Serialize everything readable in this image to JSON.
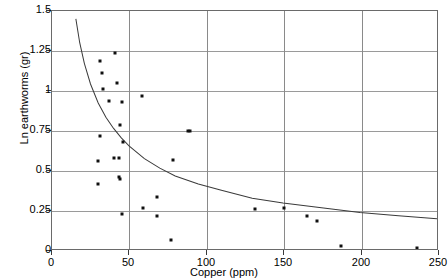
{
  "chart_data": {
    "type": "scatter",
    "title": "",
    "xlabel": "Copper (ppm)",
    "ylabel": "Ln earthworms (gr)",
    "xlim": [
      0,
      250
    ],
    "ylim": [
      0,
      1.5
    ],
    "xticks": [
      0,
      50,
      100,
      150,
      200,
      250
    ],
    "xtick_labels": [
      "0",
      "50",
      "100",
      "150",
      "200",
      "250"
    ],
    "yticks": [
      0,
      0.25,
      0.5,
      0.75,
      1,
      1.25,
      1.5
    ],
    "ytick_labels": [
      "0",
      "0.25",
      "0.5",
      "0.75",
      "1",
      "1.25",
      "1.5"
    ],
    "grid": true,
    "legend": "none",
    "marker_color": "#101010",
    "curve_color": "#3a3a3a",
    "grid_color": "#9a9a9a",
    "axis_color": "#6a6a6a",
    "points": [
      {
        "x": 31,
        "y": 1.19
      },
      {
        "x": 41,
        "y": 1.24
      },
      {
        "x": 32,
        "y": 1.11
      },
      {
        "x": 42,
        "y": 1.05
      },
      {
        "x": 33,
        "y": 1.01
      },
      {
        "x": 37,
        "y": 0.94
      },
      {
        "x": 45,
        "y": 0.93
      },
      {
        "x": 58,
        "y": 0.97
      },
      {
        "x": 44,
        "y": 0.79
      },
      {
        "x": 31,
        "y": 0.72
      },
      {
        "x": 46,
        "y": 0.68
      },
      {
        "x": 88,
        "y": 0.75
      },
      {
        "x": 89,
        "y": 0.75
      },
      {
        "x": 30,
        "y": 0.56
      },
      {
        "x": 40,
        "y": 0.58
      },
      {
        "x": 43,
        "y": 0.58
      },
      {
        "x": 78,
        "y": 0.57
      },
      {
        "x": 30,
        "y": 0.42
      },
      {
        "x": 43,
        "y": 0.46
      },
      {
        "x": 44,
        "y": 0.45
      },
      {
        "x": 68,
        "y": 0.34
      },
      {
        "x": 59,
        "y": 0.27
      },
      {
        "x": 45,
        "y": 0.23
      },
      {
        "x": 68,
        "y": 0.22
      },
      {
        "x": 77,
        "y": 0.07
      },
      {
        "x": 131,
        "y": 0.26
      },
      {
        "x": 150,
        "y": 0.27
      },
      {
        "x": 165,
        "y": 0.22
      },
      {
        "x": 171,
        "y": 0.19
      },
      {
        "x": 187,
        "y": 0.03
      },
      {
        "x": 236,
        "y": 0.02
      }
    ],
    "curve": {
      "description": "decreasing power-law fit",
      "points": [
        {
          "x": 15.5,
          "y": 1.45
        },
        {
          "x": 18,
          "y": 1.3
        },
        {
          "x": 21,
          "y": 1.17
        },
        {
          "x": 25,
          "y": 1.04
        },
        {
          "x": 30,
          "y": 0.92
        },
        {
          "x": 35,
          "y": 0.83
        },
        {
          "x": 40,
          "y": 0.76
        },
        {
          "x": 45,
          "y": 0.7
        },
        {
          "x": 50,
          "y": 0.65
        },
        {
          "x": 60,
          "y": 0.57
        },
        {
          "x": 70,
          "y": 0.51
        },
        {
          "x": 80,
          "y": 0.46
        },
        {
          "x": 95,
          "y": 0.41
        },
        {
          "x": 110,
          "y": 0.37
        },
        {
          "x": 130,
          "y": 0.32
        },
        {
          "x": 150,
          "y": 0.29
        },
        {
          "x": 175,
          "y": 0.26
        },
        {
          "x": 200,
          "y": 0.23
        },
        {
          "x": 225,
          "y": 0.21
        },
        {
          "x": 250,
          "y": 0.19
        }
      ]
    }
  }
}
